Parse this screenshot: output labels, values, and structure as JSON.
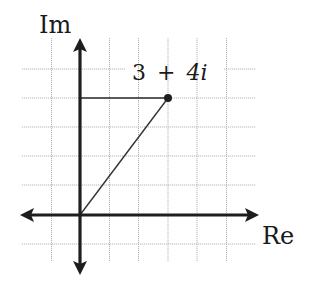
{
  "diagram": {
    "type": "complex-plane",
    "axes": {
      "imaginary_label": "Im",
      "real_label": "Re"
    },
    "point": {
      "label_real": "3",
      "label_op": "+",
      "label_imag": "4",
      "label_i": "i",
      "re": 3,
      "im": 4
    },
    "grid": {
      "x_range": [
        -2,
        5
      ],
      "y_range": [
        -1,
        5
      ]
    },
    "colors": {
      "axis": "#1e1e1e",
      "grid": "#b0b0b0",
      "vector": "#333333"
    }
  }
}
